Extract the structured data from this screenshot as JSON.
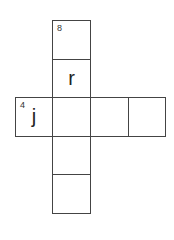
{
  "puzzle": {
    "cells": [
      {
        "id": "c1",
        "x": 52,
        "y": 20,
        "w": 39,
        "h": 40,
        "number": "8",
        "letter": ""
      },
      {
        "id": "c2",
        "x": 52,
        "y": 59,
        "w": 39,
        "h": 39,
        "number": "",
        "letter": "r"
      },
      {
        "id": "c3",
        "x": 15,
        "y": 97,
        "w": 38,
        "h": 40,
        "number": "4",
        "letter": "j"
      },
      {
        "id": "c4",
        "x": 52,
        "y": 97,
        "w": 39,
        "h": 40,
        "number": "",
        "letter": ""
      },
      {
        "id": "c5",
        "x": 90,
        "y": 97,
        "w": 39,
        "h": 40,
        "number": "",
        "letter": ""
      },
      {
        "id": "c6",
        "x": 128,
        "y": 97,
        "w": 38,
        "h": 40,
        "number": "",
        "letter": ""
      },
      {
        "id": "c7",
        "x": 52,
        "y": 136,
        "w": 39,
        "h": 39,
        "number": "",
        "letter": ""
      },
      {
        "id": "c8",
        "x": 52,
        "y": 174,
        "w": 39,
        "h": 40,
        "number": "",
        "letter": ""
      }
    ]
  }
}
